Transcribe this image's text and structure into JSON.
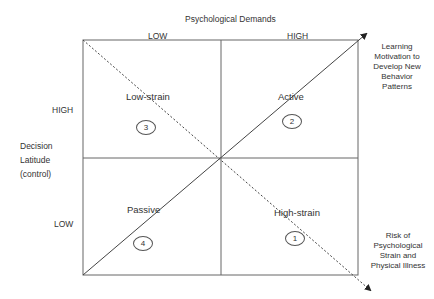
{
  "title": "Psychological Demands",
  "x_axis": {
    "low_label": "LOW",
    "high_label": "HIGH"
  },
  "y_axis": {
    "title_lines": [
      "Decision",
      "Latitude",
      "(control)"
    ],
    "high_label": "HIGH",
    "low_label": "LOW"
  },
  "quadrants": [
    {
      "name": "Low-strain",
      "number": "3",
      "position": "top-left"
    },
    {
      "name": "Active",
      "number": "2",
      "position": "top-right"
    },
    {
      "name": "Passive",
      "number": "4",
      "position": "bottom-left"
    },
    {
      "name": "High-strain",
      "number": "1",
      "position": "bottom-right"
    }
  ],
  "arrows": {
    "solid": {
      "label_lines": [
        "Learning",
        "Motivation to",
        "Develop New",
        "Behavior",
        "Patterns"
      ],
      "style": "solid"
    },
    "dashed": {
      "label_lines": [
        "Risk of",
        "Psychological",
        "Strain and",
        "Physical Illness"
      ],
      "style": "dashed"
    }
  },
  "colors": {
    "line": "#555555",
    "text": "#333333",
    "background": "#ffffff"
  }
}
